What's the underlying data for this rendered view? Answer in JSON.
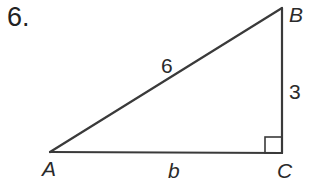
{
  "problem": {
    "number": "6."
  },
  "triangle": {
    "vertices": {
      "A": {
        "label": "A",
        "x": 50,
        "y": 152
      },
      "B": {
        "label": "B",
        "x": 282,
        "y": 8
      },
      "C": {
        "label": "C",
        "x": 282,
        "y": 153
      }
    },
    "sides": {
      "hypotenuse_AB": "6",
      "leg_BC": "3",
      "leg_AC": "b"
    },
    "right_angle_at": "C",
    "stroke_color": "#3a3a3a"
  }
}
